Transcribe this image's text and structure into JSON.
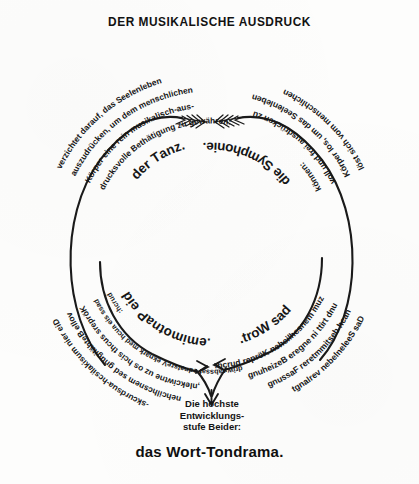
{
  "title": "DER MUSIKALISCHE AUSDRUCK",
  "diagram": {
    "type": "cycle-diagram",
    "shape": "circle",
    "quadrants": [
      {
        "id": "tanz",
        "position": "top-left",
        "lines": [
          "verzichtet darauf, das Seelenleben",
          "auszudrücken, um dem menschlichen",
          "Körper eine rein musikalisch-aus-",
          "drucksvolle Bethätigung zu gewähren:"
        ],
        "emphasis": "der Tanz."
      },
      {
        "id": "symphonie",
        "position": "top-right",
        "lines": [
          "löst sich vom menschlichen",
          "Körper los, um das Seelenleben",
          "voll und frei ausdrücken zu",
          "können:"
        ],
        "emphasis": "die Symphonie."
      },
      {
        "id": "wort",
        "position": "bottom-right",
        "lines": [
          "Das Seelenleben verlangt",
          "nach bestimmterer Fassung",
          "und tritt in engere Beziehung",
          "zum menschlichen Körper durch:"
        ],
        "emphasis": "das Wort."
      },
      {
        "id": "pantomime",
        "position": "bottom-left",
        "lines": [
          "Die rein musikalisch-ausdrucks-",
          "volle Bethätigung des menschlichen",
          "Körpers sucht sich so zu entwickeln,",
          "dass sie auch dem kranke Verstande fassbar wird",
          "durch:"
        ],
        "emphasis": "die Pantomime."
      }
    ],
    "center": {
      "lines": [
        "Die höchste",
        "Entwicklungs-",
        "stufe Beider:"
      ]
    },
    "result": "das Wort-Tondrama.",
    "arrows": [
      {
        "name": "top-left-inward-arrow",
        "direction": "right"
      },
      {
        "name": "top-right-inward-arrow",
        "direction": "left"
      },
      {
        "name": "bottom-left-inward-arrow",
        "direction": "right"
      },
      {
        "name": "bottom-right-inward-arrow",
        "direction": "left"
      },
      {
        "name": "convergence-down-arrow",
        "direction": "down"
      }
    ],
    "ink_color": "#161616",
    "paper_color": "#fdfdfc"
  }
}
